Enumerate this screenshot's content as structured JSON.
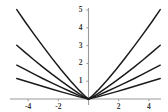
{
  "figure": {
    "width": 168,
    "height": 112,
    "background_color": "#ffffff",
    "curve_color": "#1a1a1a",
    "axis_color": "#9a9a9a",
    "tick_label_color": "#3a3a3a"
  },
  "chart_data": {
    "type": "line",
    "title": "",
    "subtitle": "",
    "xlabel": "",
    "ylabel": "",
    "grid": false,
    "legend": "none",
    "axes": {
      "x_axis_position_y": 0,
      "y_axis_position_x": 0,
      "xlim": [
        -4.75,
        4.75
      ],
      "ylim": [
        -0.45,
        5.45
      ],
      "x_ticks": [
        -4,
        -2,
        2,
        4
      ],
      "x_tick_labels": [
        "-4",
        "-2",
        "2",
        "4"
      ],
      "y_ticks": [
        1,
        2,
        3,
        4,
        5
      ],
      "y_tick_labels": [
        "1",
        "2",
        "3",
        "4",
        "5"
      ]
    },
    "series": [
      {
        "name": "branch-1-left",
        "x": [
          -4.75,
          -4.2,
          -3.6,
          -3.0,
          -2.4,
          -1.8,
          -1.2,
          -0.6,
          -0.25,
          0
        ],
        "y": [
          5.02,
          4.34,
          3.63,
          2.94,
          2.27,
          1.63,
          1.03,
          0.47,
          0.18,
          0
        ]
      },
      {
        "name": "branch-1-right",
        "x": [
          0,
          0.25,
          0.6,
          1.2,
          1.8,
          2.4,
          3.0,
          3.6,
          4.2,
          4.75
        ],
        "y": [
          0,
          0.18,
          0.47,
          1.03,
          1.63,
          2.27,
          2.94,
          3.63,
          4.34,
          5.02
        ]
      },
      {
        "name": "branch-2-left",
        "x": [
          -4.75,
          -4.2,
          -3.6,
          -3.0,
          -2.4,
          -1.8,
          -1.2,
          -0.6,
          -0.25,
          0
        ],
        "y": [
          3.02,
          2.62,
          2.19,
          1.78,
          1.38,
          1.0,
          0.64,
          0.29,
          0.11,
          0
        ]
      },
      {
        "name": "branch-2-right",
        "x": [
          0,
          0.25,
          0.6,
          1.2,
          1.8,
          2.4,
          3.0,
          3.6,
          4.2,
          4.75
        ],
        "y": [
          0,
          0.11,
          0.29,
          0.64,
          1.0,
          1.38,
          1.78,
          2.19,
          2.62,
          3.02
        ]
      },
      {
        "name": "branch-3-left",
        "x": [
          -4.75,
          -4.2,
          -3.6,
          -3.0,
          -2.4,
          -1.8,
          -1.2,
          -0.6,
          -0.25,
          0
        ],
        "y": [
          1.9,
          1.66,
          1.4,
          1.14,
          0.89,
          0.65,
          0.42,
          0.19,
          0.075,
          0
        ]
      },
      {
        "name": "branch-3-right",
        "x": [
          0,
          0.25,
          0.6,
          1.2,
          1.8,
          2.4,
          3.0,
          3.6,
          4.2,
          4.75
        ],
        "y": [
          0,
          0.075,
          0.19,
          0.42,
          0.65,
          0.89,
          1.14,
          1.4,
          1.66,
          1.9
        ]
      },
      {
        "name": "branch-4-left",
        "x": [
          -4.75,
          -4.2,
          -3.6,
          -3.0,
          -2.4,
          -1.8,
          -1.2,
          -0.6,
          -0.25,
          0
        ],
        "y": [
          1.15,
          1.01,
          0.86,
          0.7,
          0.55,
          0.4,
          0.26,
          0.12,
          0.05,
          0
        ]
      },
      {
        "name": "branch-4-right",
        "x": [
          0,
          0.25,
          0.6,
          1.2,
          1.8,
          2.4,
          3.0,
          3.6,
          4.2,
          4.75
        ],
        "y": [
          0,
          0.05,
          0.12,
          0.26,
          0.4,
          0.55,
          0.7,
          0.86,
          1.01,
          1.15
        ]
      }
    ]
  }
}
